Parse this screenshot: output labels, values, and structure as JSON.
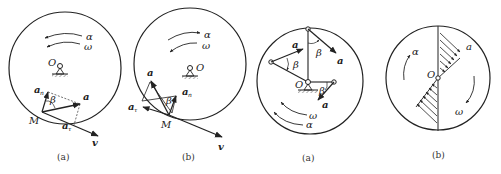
{
  "figure": {
    "panels": [
      {
        "id": "left-a",
        "caption": "(a)",
        "labels": {
          "alpha": "α",
          "omega": "ω",
          "center": "O",
          "point": "M",
          "accel": "a",
          "accel_n": "a",
          "accel_n_sub": "n",
          "accel_t": "a",
          "accel_t_sub": "τ",
          "angle": "β",
          "velocity": "v"
        }
      },
      {
        "id": "left-b",
        "caption": "(b)",
        "labels": {
          "alpha": "α",
          "omega": "ω",
          "center": "O",
          "point": "M",
          "accel": "a",
          "accel_n": "a",
          "accel_n_sub": "n",
          "accel_t": "a",
          "accel_t_sub": "τ",
          "angle": "β",
          "velocity": "v"
        }
      },
      {
        "id": "right-a",
        "caption": "(a)",
        "labels": {
          "center": "O",
          "accel_1": "a",
          "accel_2": "a",
          "accel_3": "a",
          "angle_1": "β",
          "angle_2": "β",
          "angle_3": "β",
          "omega": "ω",
          "alpha": "α"
        }
      },
      {
        "id": "right-b",
        "caption": "(b)",
        "labels": {
          "center": "O",
          "alpha": "α",
          "omega": "ω",
          "accel": "a"
        }
      }
    ]
  }
}
